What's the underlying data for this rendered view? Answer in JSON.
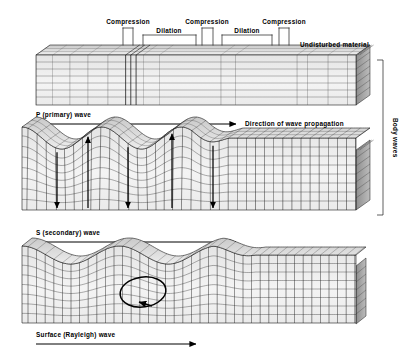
{
  "figure": {
    "title_present": false,
    "background": "#ffffff",
    "ink": "#000000",
    "block_fill_light": "#f2f2f2",
    "block_fill_mid": "#d8d8d8",
    "block_fill_dark": "#9a9a9a"
  },
  "annotations": {
    "compression_1": "Compression",
    "compression_2": "Compression",
    "compression_3": "Compression",
    "dilation_1": "Dilation",
    "dilation_2": "Dilation",
    "undisturbed": "Undisturbed material",
    "body_waves": "Body waves"
  },
  "panels": [
    {
      "id": "p-wave",
      "label": "P (primary) wave",
      "direction_label": "Direction of wave propagation",
      "wave_type": "compressional",
      "has_direction_arrow": true
    },
    {
      "id": "s-wave",
      "label": "S (secondary) wave",
      "direction_label": "",
      "wave_type": "shear",
      "has_direction_arrow": true
    },
    {
      "id": "surface-wave",
      "label": "Surface (Rayleigh) wave",
      "direction_label": "",
      "wave_type": "rayleigh",
      "has_direction_arrow": true
    }
  ],
  "chart_data": {
    "type": "diagram",
    "panel_count": 3,
    "p_wave": {
      "zones": [
        {
          "kind": "compression",
          "x_start": 123,
          "x_end": 133
        },
        {
          "kind": "dilation",
          "x_start": 143,
          "x_end": 196
        },
        {
          "kind": "compression",
          "x_start": 202,
          "x_end": 213
        },
        {
          "kind": "dilation",
          "x_start": 222,
          "x_end": 272
        },
        {
          "kind": "compression",
          "x_start": 279,
          "x_end": 289
        }
      ],
      "block": {
        "x": 36,
        "y": 55,
        "width": 320,
        "height": 50,
        "depth": 14
      }
    },
    "s_wave": {
      "block": {
        "x": 22,
        "y": 138,
        "width": 334,
        "height": 72,
        "depth": 14
      },
      "wave_amplitude": 11,
      "wave_cycles": 2.6,
      "deformed_fraction": 0.62,
      "arrows": [
        {
          "x": 57,
          "dir": "down"
        },
        {
          "x": 88,
          "dir": "up"
        },
        {
          "x": 128,
          "dir": "down"
        },
        {
          "x": 172,
          "dir": "up"
        },
        {
          "x": 213,
          "dir": "down"
        }
      ]
    },
    "surface_wave": {
      "block": {
        "x": 22,
        "y": 255,
        "width": 334,
        "height": 68,
        "depth": 10
      },
      "wave_amplitude": 9,
      "wave_cycles": 2.4,
      "ellipse": {
        "cx": 143,
        "cy": 292,
        "rx": 23,
        "ry": 15,
        "rotation_deg": -8,
        "sense": "retrograde"
      }
    },
    "body_wave_bracket": {
      "x": 381,
      "y_top": 60,
      "y_bottom": 215
    }
  }
}
